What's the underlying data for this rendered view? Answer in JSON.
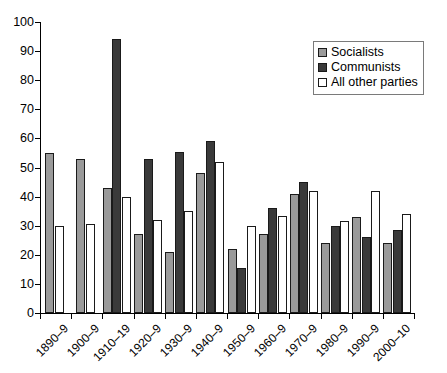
{
  "chart_data": {
    "type": "bar",
    "title": "",
    "subtitle": "",
    "xlabel": "",
    "ylabel": "",
    "ylim": [
      0,
      100
    ],
    "ytick_values": [
      0,
      10,
      20,
      30,
      40,
      50,
      60,
      70,
      80,
      90,
      100
    ],
    "ytick_labels": [
      "0",
      "10",
      "20",
      "30",
      "40",
      "50",
      "60",
      "70",
      "80",
      "90",
      "100"
    ],
    "grid": false,
    "legend_position": "upper right",
    "categories": [
      "1890–9",
      "1900–9",
      "1910–19",
      "1920–9",
      "1930–9",
      "1940–9",
      "1950–9",
      "1960–9",
      "1970–9",
      "1980–9",
      "1990–9",
      "2000–10"
    ],
    "series": [
      {
        "name": "Socialists",
        "color": "#9a9a9a",
        "values": [
          55,
          53,
          43,
          27,
          21,
          48,
          22,
          27,
          41,
          24,
          33,
          24
        ]
      },
      {
        "name": "Communists",
        "color": "#3a3a3a",
        "values": [
          null,
          null,
          94,
          53,
          55.5,
          59,
          15.5,
          36,
          45,
          30,
          26,
          28.5
        ]
      },
      {
        "name": "All other parties",
        "color": "#ffffff",
        "values": [
          30,
          30.5,
          40,
          32,
          35,
          52,
          30,
          33.5,
          42,
          31.5,
          42,
          34
        ]
      }
    ]
  },
  "legend": {
    "entries": [
      {
        "label": "Socialists",
        "swatch": "socialists"
      },
      {
        "label": "Communists",
        "swatch": "communists"
      },
      {
        "label": "All other parties",
        "swatch": "allother"
      }
    ]
  },
  "colors": {
    "socialists": "#9a9a9a",
    "communists": "#3a3a3a",
    "all_other_parties": "#ffffff",
    "axis": "#000000",
    "bar_outline": "#1a1a1a",
    "legend_border": "#7a7a7a"
  }
}
